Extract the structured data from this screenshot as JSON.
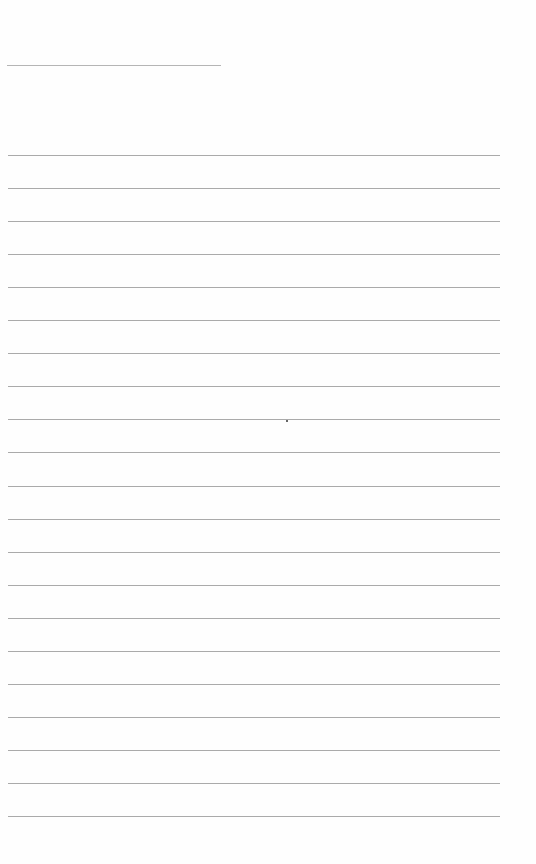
{
  "document": {
    "type": "lined-paper",
    "title_line": {
      "visible": true
    },
    "rules": {
      "count": 21,
      "first_y": 155,
      "spacing": 33.05
    },
    "colors": {
      "background": "#fefefe",
      "rule": "#aaaaaa",
      "title_line": "#b5b5b5"
    }
  }
}
